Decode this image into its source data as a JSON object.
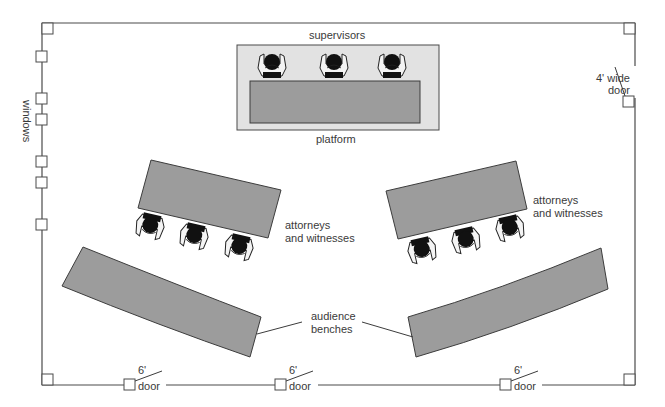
{
  "diagram": {
    "colors": {
      "wall": "#4a4a4a",
      "table_fill": "#9c9c9c",
      "platform_fill": "#e2e2e2",
      "person_head": "#111111",
      "person_body": "#f4f4f4",
      "text": "#3a3a3a"
    },
    "labels": {
      "supervisors": "supervisors",
      "platform": "platform",
      "windows": "windows",
      "right_door_line1": "4' wide",
      "right_door_line2": "door",
      "attorneys_left_line1": "attorneys",
      "attorneys_left_line2": "and witnesses",
      "attorneys_right_line1": "attorneys",
      "attorneys_right_line2": "and witnesses",
      "audience_line1": "audience",
      "audience_line2": "benches"
    },
    "bottom_doors": [
      {
        "size": "6'",
        "label": "door"
      },
      {
        "size": "6'",
        "label": "door"
      },
      {
        "size": "6'",
        "label": "door"
      }
    ],
    "people": {
      "supervisors": 3,
      "attorneys_left": 3,
      "attorneys_right": 3
    },
    "left_wall_windows": 6
  }
}
